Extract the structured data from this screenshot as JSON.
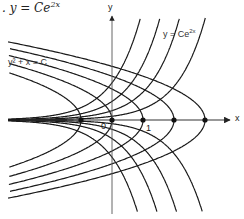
{
  "title": {
    "prefix": ". y = Ce",
    "exponent": "2x"
  },
  "labels": {
    "parabola_family": "y² + x = C",
    "exp_family_base": "y = Ce",
    "exp_family_exp": "2x",
    "y_axis": "y",
    "x_axis": "x",
    "origin": "0",
    "tick_one": "1"
  },
  "colors": {
    "curve": "#1a1a1a",
    "axis": "#333333",
    "text": "#222222"
  },
  "geometry": {
    "origin_px": [
      112,
      120
    ],
    "unit_px": 31,
    "x_axis_range_px": [
      20,
      230
    ],
    "y_axis_range_px": [
      16,
      214
    ]
  },
  "diagram": {
    "families": [
      {
        "name": "orthogonal trajectories",
        "equation": "y^2 + x = C",
        "C_values": [
          -1,
          0,
          1,
          2,
          3
        ]
      },
      {
        "name": "exponential family",
        "equation": "y = Ce^(2x)",
        "C_values": [
          0.6,
          0.3,
          0.12,
          -0.12,
          -0.3,
          -0.6,
          1.2,
          -1.2
        ]
      }
    ],
    "vertex_points_x": [
      -1,
      0,
      1,
      2,
      3
    ]
  }
}
